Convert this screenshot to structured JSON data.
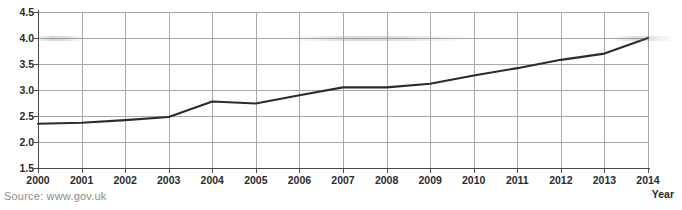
{
  "figure": {
    "source_note": "Source: www.gov.uk",
    "x_axis_title": "Year",
    "title_remnant": ""
  },
  "chart_data": {
    "type": "line",
    "title": "",
    "subtitle": "",
    "xlabel": "Year",
    "ylabel": "",
    "categories": [
      "2000",
      "2001",
      "2002",
      "2003",
      "2004",
      "2005",
      "2006",
      "2007",
      "2008",
      "2009",
      "2010",
      "2011",
      "2012",
      "2013",
      "2014"
    ],
    "x": [
      2000,
      2001,
      2002,
      2003,
      2004,
      2005,
      2006,
      2007,
      2008,
      2009,
      2010,
      2011,
      2012,
      2013,
      2014
    ],
    "values": [
      2.35,
      2.37,
      2.42,
      2.48,
      2.78,
      2.74,
      2.9,
      3.05,
      3.05,
      3.12,
      3.28,
      3.42,
      3.58,
      3.7,
      4.0
    ],
    "series": [
      {
        "name": "",
        "values": [
          2.35,
          2.37,
          2.42,
          2.48,
          2.78,
          2.74,
          2.9,
          3.05,
          3.05,
          3.12,
          3.28,
          3.42,
          3.58,
          3.7,
          4.0
        ]
      }
    ],
    "ylim": [
      1.5,
      4.5
    ],
    "xlim": [
      2000,
      2014
    ],
    "yticks": [
      1.5,
      2.0,
      2.5,
      3.0,
      3.5,
      4.0,
      4.5
    ],
    "ytick_labels": [
      "1.5",
      "2.0",
      "2.5",
      "3.0",
      "3.5",
      "4.0",
      "4.5"
    ],
    "xticks": [
      2000,
      2001,
      2002,
      2003,
      2004,
      2005,
      2006,
      2007,
      2008,
      2009,
      2010,
      2011,
      2012,
      2013,
      2014
    ],
    "xtick_labels": [
      "2000",
      "2001",
      "2002",
      "2003",
      "2004",
      "2005",
      "2006",
      "2007",
      "2008",
      "2009",
      "2010",
      "2011",
      "2012",
      "2013",
      "2014"
    ],
    "grid": true,
    "grid_axis": "both",
    "legend": false,
    "legend_position": "none",
    "line_color": "#2b2b2b",
    "grid_color": "#a9a9a9",
    "axis_color": "#4a4a4a",
    "background": "#ffffff",
    "annotations": []
  }
}
